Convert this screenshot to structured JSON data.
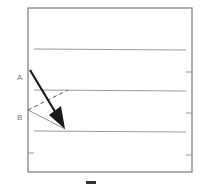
{
  "diagram": {
    "labels": {
      "a": "A",
      "b": "B"
    },
    "colors": {
      "frame": "#7a7a7a",
      "lines": "#999999",
      "arrow": "#1a1a1a",
      "dashed": "#555555",
      "label": "#777777"
    },
    "horizontal_lines_y": [
      49,
      90,
      131
    ],
    "right_ticks_y": [
      72,
      113,
      155
    ],
    "left_ticks_y": [
      153
    ]
  }
}
